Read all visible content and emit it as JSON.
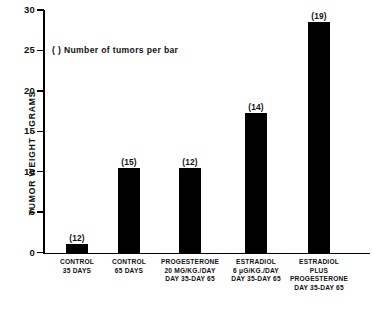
{
  "chart_data": {
    "type": "bar",
    "title": "",
    "xlabel": "",
    "ylabel": "TUMOR WEIGHT : GRAMS",
    "ylim": [
      0,
      30
    ],
    "ytick_labels": [
      "0",
      "5",
      "10",
      "15",
      "20",
      "25",
      "30"
    ],
    "ytick_values": [
      0,
      5,
      10,
      15,
      20,
      25,
      30
    ],
    "grid": false,
    "legend_note": "(  ) Number of tumors per bar",
    "categories": [
      "CONTROL\n35 DAYS",
      "CONTROL\n65 DAYS",
      "PROGESTERONE\n20 MG/KG./DAY\nDAY 35-DAY 65",
      "ESTRADIOL\n6 μG/KG./DAY\nDAY 35-DAY 65",
      "ESTRADIOL\nPLUS\nPROGESTERONE\nDAY 35-DAY 65"
    ],
    "values": [
      1.0,
      10.5,
      10.4,
      17.3,
      28.5
    ],
    "annotations": [
      "(12)",
      "(15)",
      "(12)",
      "(14)",
      "(19)"
    ],
    "bar_color": "#000000"
  }
}
